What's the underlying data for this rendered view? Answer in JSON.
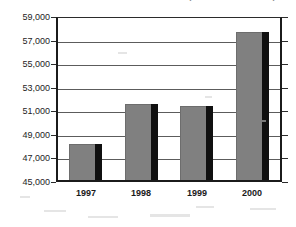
{
  "chart_data": {
    "type": "bar",
    "title": "(Million Dollars)",
    "xlabel": "",
    "ylabel": "",
    "categories": [
      "1997",
      "1998",
      "1999",
      "2000"
    ],
    "values": [
      48050,
      51530,
      51350,
      57710
    ],
    "series": [
      {
        "name": "Value",
        "values": [
          48050,
          51530,
          51350,
          57710
        ]
      }
    ],
    "ylim": [
      45000,
      59000
    ],
    "ytick_step": 2000,
    "ytick_labels": [
      "59,000",
      "57,000",
      "55,000",
      "53,000",
      "51,000",
      "49,000",
      "47,000",
      "45,000"
    ],
    "ytick_values": [
      59000,
      57000,
      55000,
      53000,
      51000,
      49000,
      47000,
      45000
    ],
    "grid": true,
    "legend": "none",
    "legend_position": "none",
    "bar_color": "#808080",
    "bar_shadow_color": "#101010",
    "gridline_color": "#5c5c5c",
    "axis_color": "#1b1b1b",
    "background_color": "#ffffff"
  }
}
